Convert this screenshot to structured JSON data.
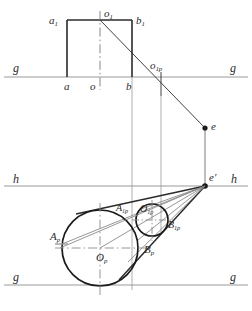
{
  "figure": {
    "kind": "descriptive-geometry-perspective-construction",
    "colors": {
      "line_dark": "#2b2b2b",
      "line_gray": "#9a9a9a",
      "line_mid": "#6e6e6e",
      "background": "#ffffff"
    }
  },
  "labels": {
    "a1": {
      "text": "a",
      "sub": "1",
      "x": 49,
      "y": 15
    },
    "o1": {
      "text": "o",
      "sub": "1",
      "x": 104,
      "y": 8
    },
    "b1": {
      "text": "b",
      "sub": "1",
      "x": 136,
      "y": 15
    },
    "g_top_left": {
      "text": "g",
      "sub": "",
      "x": 13,
      "y": 66
    },
    "g_top_right": {
      "text": "g",
      "sub": "",
      "x": 230,
      "y": 66
    },
    "a": {
      "text": "a",
      "sub": "",
      "x": 64,
      "y": 82
    },
    "o": {
      "text": "o",
      "sub": "",
      "x": 92,
      "y": 82
    },
    "b": {
      "text": "b",
      "sub": "",
      "x": 126,
      "y": 82
    },
    "o1p": {
      "text": "o",
      "sub": "1p",
      "x": 152,
      "y": 63
    },
    "e": {
      "text": "e",
      "sub": "",
      "x": 211,
      "y": 122
    },
    "e_prime": {
      "text": "e'",
      "sub": "",
      "x": 210,
      "y": 174
    },
    "h_left": {
      "text": "h",
      "sub": "",
      "x": 13,
      "y": 177
    },
    "h_right": {
      "text": "h",
      "sub": "",
      "x": 231,
      "y": 177
    },
    "A1p": {
      "text": "A",
      "sub": "1p",
      "x": 118,
      "y": 205
    },
    "O1p": {
      "text": "O",
      "sub": "1p",
      "x": 141,
      "y": 205
    },
    "B1p": {
      "text": "B",
      "sub": "1p",
      "x": 168,
      "y": 221
    },
    "Ap": {
      "text": "A",
      "sub": "p",
      "x": 51,
      "y": 232
    },
    "Bp": {
      "text": "B",
      "sub": "p",
      "x": 144,
      "y": 245
    },
    "Op": {
      "text": "O",
      "sub": "p",
      "x": 97,
      "y": 253
    },
    "g_bottom_left": {
      "text": "g",
      "sub": "",
      "x": 13,
      "y": 275
    },
    "g_bottom_right": {
      "text": "g",
      "sub": "",
      "x": 230,
      "y": 275
    }
  },
  "geometry": {
    "ground_line_top_y": 77,
    "horizon_line_y": 186,
    "ground_line_bottom_y": 285,
    "square": {
      "left": 67,
      "right": 132,
      "top": 20,
      "bottom": 77
    },
    "big_circle": {
      "cx": 100,
      "cy": 248,
      "r": 38
    },
    "small_circle": {
      "cx": 152,
      "cy": 220,
      "r": 16
    },
    "vanishing_point": {
      "x": 205,
      "y": 186
    },
    "point_e": {
      "x": 205,
      "y": 128
    },
    "point_o1p": {
      "x": 161,
      "y": 77
    }
  }
}
